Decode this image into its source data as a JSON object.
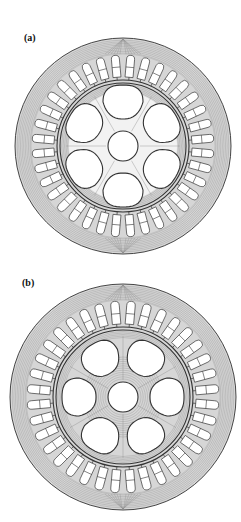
{
  "figure": {
    "panels": [
      {
        "id": "a",
        "label": "(a)",
        "label_pos": [
          24,
          43
        ],
        "center": [
          123,
          146
        ],
        "stator_outer_r": 108,
        "stator_inner_r": 66,
        "rotor_r": 63,
        "slot_count": 36,
        "slot_angle_offset_deg": 5,
        "slot_inner_r": 69,
        "slot_outer_r": 91,
        "slot_width": 8,
        "rotor_holes": {
          "count": 6,
          "angle_offset_deg": 0,
          "distance": 44,
          "width": 40,
          "height": 34
        },
        "center_hole_r": 15,
        "flux_in_rotor": false
      },
      {
        "id": "b",
        "label": "(b)",
        "label_pos": [
          22,
          288
        ],
        "center": [
          123,
          397
        ],
        "stator_outer_r": 113,
        "stator_inner_r": 70,
        "rotor_r": 67,
        "slot_count": 36,
        "slot_angle_offset_deg": 5,
        "slot_inner_r": 73,
        "slot_outer_r": 96,
        "slot_width": 8.5,
        "rotor_holes": {
          "count": 6,
          "angle_offset_deg": 30,
          "distance": 44,
          "width": 38,
          "height": 34
        },
        "center_hole_r": 15,
        "flux_in_rotor": true
      }
    ],
    "colors": {
      "background": "#ffffff",
      "flux_fill": "#d6d6d6",
      "flux_line": "#8a8a8a",
      "outline": "#333333",
      "label": "#111111"
    }
  }
}
